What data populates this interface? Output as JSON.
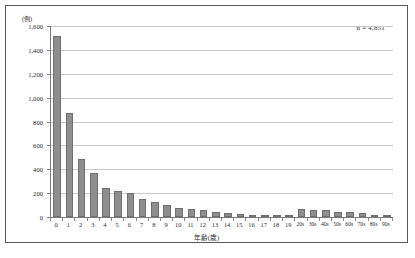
{
  "figure": {
    "unit_label": "(例)",
    "annotation": "n = 4,851",
    "xaxis_title": "年齢(歳)",
    "bar_color": "#8e8e8e",
    "grid_color": "#c9c9c9",
    "axis_color": "#7a7a7a",
    "frame_color": "#5a5a5a"
  },
  "chart_data": {
    "type": "bar",
    "title": "",
    "xlabel": "年齢(歳)",
    "ylabel": "(例)",
    "ylim": [
      0,
      1600
    ],
    "ytick_values": [
      0,
      200,
      400,
      600,
      800,
      1000,
      1200,
      1400,
      1600
    ],
    "ytick_labels": [
      "0",
      "200",
      "400",
      "600",
      "800",
      "1,000",
      "1,200",
      "1,400",
      "1,600"
    ],
    "grid": true,
    "legend": false,
    "annotations": [
      "n = 4,851"
    ],
    "total_n": 4851,
    "categories": [
      "0",
      "1",
      "2",
      "3",
      "4",
      "5",
      "6",
      "7",
      "8",
      "9",
      "10",
      "11",
      "12",
      "13",
      "14",
      "15",
      "16",
      "17",
      "18",
      "19",
      "20s",
      "30s",
      "40s",
      "50s",
      "60s",
      "70s",
      "80s",
      "90s"
    ],
    "values": [
      1520,
      870,
      485,
      370,
      240,
      215,
      200,
      155,
      125,
      100,
      78,
      70,
      55,
      45,
      30,
      22,
      20,
      18,
      15,
      14,
      70,
      62,
      60,
      45,
      40,
      32,
      20,
      8
    ]
  }
}
